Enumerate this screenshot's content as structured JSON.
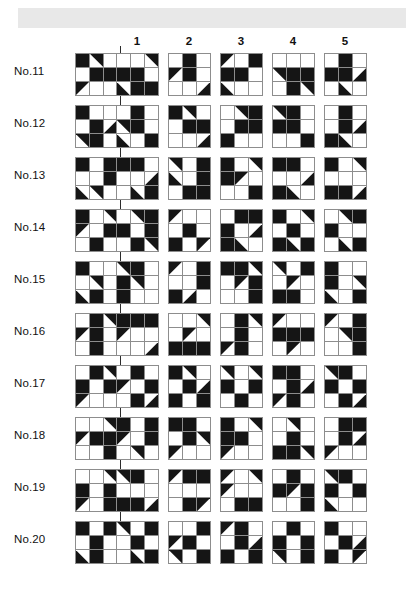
{
  "page": {
    "top_band_color": "#e8e8e8",
    "fill_color": "#151515",
    "grid_line_color": "#8d8d8d"
  },
  "column_headers": [
    {
      "label": "1",
      "x": 137
    },
    {
      "label": "2",
      "x": 189
    },
    {
      "label": "3",
      "x": 241
    },
    {
      "label": "4",
      "x": 293
    },
    {
      "label": "5",
      "x": 345
    }
  ],
  "option_x": [
    137,
    189,
    241,
    293,
    345
  ],
  "legend": {
    "cell_codes": {
      "0": "white cell",
      "1": "solid black cell",
      "tl": "black triangle in top-left half",
      "tr": "black triangle in top-right half",
      "bl": "black triangle in bottom-left half",
      "br": "black triangle in bottom-right half"
    }
  },
  "rows": [
    {
      "label": "No.11",
      "y": 48,
      "question": [
        "1",
        "tr",
        "0",
        "0",
        "1",
        "1",
        "tl",
        "0",
        "0"
      ],
      "options": [
        [
          "0",
          "0",
          "tr",
          "1",
          "1",
          "0",
          "bl",
          "1",
          "1"
        ],
        [
          "0",
          "1",
          "0",
          "tl",
          "1",
          "0",
          "0",
          "0",
          "br"
        ],
        [
          "tl",
          "0",
          "1",
          "1",
          "1",
          "0",
          "bl",
          "0",
          "0"
        ],
        [
          "0",
          "0",
          "0",
          "tr",
          "1",
          "1",
          "0",
          "1",
          "tr"
        ],
        [
          "0",
          "1",
          "0",
          "1",
          "1",
          "br",
          "0",
          "bl",
          "0"
        ]
      ]
    },
    {
      "label": "No.12",
      "y": 100,
      "question": [
        "1",
        "0",
        "0",
        "0",
        "1",
        "br",
        "tr",
        "1",
        "0"
      ],
      "options": [
        [
          "0",
          "1",
          "0",
          "tr",
          "1",
          "0",
          "bl",
          "0",
          "1"
        ],
        [
          "1",
          "tr",
          "0",
          "0",
          "1",
          "1",
          "0",
          "0",
          "br"
        ],
        [
          "0",
          "tr",
          "1",
          "0",
          "1",
          "1",
          "1",
          "0",
          "0"
        ],
        [
          "tr",
          "1",
          "0",
          "1",
          "1",
          "0",
          "0",
          "0",
          "1"
        ],
        [
          "0",
          "1",
          "0",
          "0",
          "1",
          "br",
          "1",
          "bl",
          "0"
        ]
      ]
    },
    {
      "label": "No.13",
      "y": 152,
      "question": [
        "1",
        "0",
        "1",
        "0",
        "0",
        "1",
        "bl",
        "tr",
        "0"
      ],
      "options": [
        [
          "1",
          "1",
          "0",
          "0",
          "0",
          "br",
          "0",
          "bl",
          "1"
        ],
        [
          "tr",
          "0",
          "1",
          "bl",
          "0",
          "1",
          "0",
          "1",
          "1"
        ],
        [
          "1",
          "0",
          "tr",
          "1",
          "tl",
          "0",
          "0",
          "0",
          "1"
        ],
        [
          "1",
          "1",
          "0",
          "0",
          "0",
          "br",
          "1",
          "bl",
          "0"
        ],
        [
          "1",
          "0",
          "tr",
          "0",
          "0",
          "0",
          "1",
          "1",
          "br"
        ]
      ]
    },
    {
      "label": "No.14",
      "y": 204,
      "question": [
        "1",
        "0",
        "tr",
        "tl",
        "0",
        "1",
        "0",
        "1",
        "0"
      ],
      "options": [
        [
          "0",
          "tr",
          "1",
          "1",
          "0",
          "1",
          "0",
          "1",
          "tr"
        ],
        [
          "tl",
          "0",
          "0",
          "0",
          "1",
          "0",
          "1",
          "0",
          "tl"
        ],
        [
          "0",
          "1",
          "1",
          "1",
          "0",
          "br",
          "1",
          "bl",
          "0"
        ],
        [
          "1",
          "0",
          "tr",
          "0",
          "1",
          "0",
          "1",
          "bl",
          "1"
        ],
        [
          "0",
          "tr",
          "1",
          "1",
          "0",
          "0",
          "0",
          "bl",
          "1"
        ]
      ]
    },
    {
      "label": "No.15",
      "y": 256,
      "question": [
        "1",
        "0",
        "0",
        "0",
        "tr",
        "0",
        "bl",
        "1",
        "0"
      ],
      "options": [
        [
          "tr",
          "1",
          "0",
          "1",
          "tr",
          "0",
          "1",
          "0",
          "0"
        ],
        [
          "tl",
          "0",
          "1",
          "0",
          "0",
          "1",
          "1",
          "br",
          "0"
        ],
        [
          "1",
          "1",
          "tr",
          "0",
          "tl",
          "1",
          "0",
          "0",
          "1"
        ],
        [
          "tr",
          "0",
          "1",
          "0",
          "tl",
          "0",
          "1",
          "1",
          "0"
        ],
        [
          "1",
          "0",
          "0",
          "1",
          "0",
          "tr",
          "bl",
          "0",
          "1"
        ]
      ]
    },
    {
      "label": "No.16",
      "y": 308,
      "question": [
        "0",
        "1",
        "tr",
        "tl",
        "1",
        "0",
        "0",
        "1",
        "0"
      ],
      "options": [
        [
          "1",
          "1",
          "1",
          "tl",
          "0",
          "0",
          "0",
          "0",
          "br"
        ],
        [
          "0",
          "0",
          "tr",
          "0",
          "tl",
          "0",
          "1",
          "1",
          "1"
        ],
        [
          "0",
          "1",
          "tr",
          "0",
          "1",
          "0",
          "tl",
          "1",
          "0"
        ],
        [
          "tl",
          "0",
          "0",
          "1",
          "1",
          "1",
          "0",
          "tl",
          "0"
        ],
        [
          "tl",
          "0",
          "1",
          "0",
          "tr",
          "1",
          "0",
          "0",
          "1"
        ]
      ]
    },
    {
      "label": "No.17",
      "y": 360,
      "question": [
        "0",
        "1",
        "tr",
        "1",
        "0",
        "1",
        "tl",
        "0",
        "0"
      ],
      "options": [
        [
          "0",
          "1",
          "0",
          "tl",
          "0",
          "1",
          "0",
          "1",
          "br"
        ],
        [
          "1",
          "tr",
          "0",
          "0",
          "1",
          "br",
          "1",
          "0",
          "1"
        ],
        [
          "tr",
          "0",
          "tr",
          "1",
          "0",
          "1",
          "0",
          "1",
          "0"
        ],
        [
          "1",
          "1",
          "0",
          "0",
          "1",
          "br",
          "tl",
          "1",
          "0"
        ],
        [
          "tr",
          "1",
          "0",
          "1",
          "0",
          "1",
          "0",
          "1",
          "br"
        ]
      ]
    },
    {
      "label": "No.18",
      "y": 412,
      "question": [
        "0",
        "0",
        "tr",
        "tl",
        "1",
        "1",
        "0",
        "0",
        "1"
      ],
      "options": [
        [
          "1",
          "0",
          "1",
          "tl",
          "0",
          "1",
          "0",
          "tr",
          "0"
        ],
        [
          "1",
          "1",
          "0",
          "0",
          "1",
          "tr",
          "tl",
          "0",
          "0"
        ],
        [
          "1",
          "0",
          "tr",
          "1",
          "1",
          "0",
          "tl",
          "0",
          "0"
        ],
        [
          "0",
          "tr",
          "0",
          "0",
          "1",
          "0",
          "1",
          "1",
          "tr"
        ],
        [
          "0",
          "1",
          "1",
          "0",
          "1",
          "br",
          "tl",
          "0",
          "0"
        ]
      ]
    },
    {
      "label": "No.19",
      "y": 464,
      "question": [
        "0",
        "0",
        "tr",
        "1",
        "0",
        "1",
        "tl",
        "0",
        "1"
      ],
      "options": [
        [
          "tr",
          "1",
          "0",
          "0",
          "0",
          "0",
          "1",
          "1",
          "br"
        ],
        [
          "tl",
          "1",
          "1",
          "0",
          "0",
          "0",
          "0",
          "1",
          "tl"
        ],
        [
          "tl",
          "0",
          "tr",
          "tl",
          "0",
          "0",
          "0",
          "1",
          "1"
        ],
        [
          "0",
          "1",
          "0",
          "1",
          "tl",
          "1",
          "0",
          "0",
          "1"
        ],
        [
          "tr",
          "1",
          "0",
          "1",
          "0",
          "1",
          "bl",
          "0",
          "0"
        ]
      ]
    },
    {
      "label": "No.20",
      "y": 516,
      "question": [
        "1",
        "0",
        "1",
        "0",
        "1",
        "0",
        "bl",
        "1",
        "0"
      ],
      "options": [
        [
          "tr",
          "0",
          "1",
          "0",
          "1",
          "0",
          "0",
          "bl",
          "1"
        ],
        [
          "0",
          "0",
          "1",
          "tl",
          "1",
          "0",
          "tr",
          "0",
          "1"
        ],
        [
          "tl",
          "1",
          "0",
          "0",
          "1",
          "br",
          "1",
          "0",
          "1"
        ],
        [
          "0",
          "1",
          "0",
          "1",
          "0",
          "1",
          "tr",
          "0",
          "1"
        ],
        [
          "1",
          "0",
          "0",
          "0",
          "1",
          "br",
          "1",
          "0",
          "tl"
        ]
      ]
    }
  ]
}
